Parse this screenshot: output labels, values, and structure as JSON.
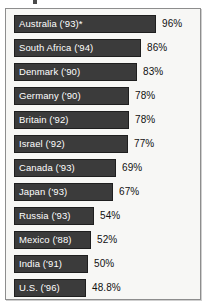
{
  "chart_data": {
    "type": "bar",
    "orientation": "horizontal",
    "title": "",
    "xlabel": "",
    "ylabel": "",
    "xlim": [
      0,
      100
    ],
    "grid": false,
    "legend": null,
    "value_suffix": "%",
    "categories": [
      "Australia ('93)*",
      "South Africa ('94)",
      "Denmark ('90)",
      "Germany ('90)",
      "Britain ('92)",
      "Israel ('92)",
      "Canada ('93)",
      "Japan ('93)",
      "Russia ('93)",
      "Mexico ('88)",
      "India ('91)",
      "U.S. ('96)"
    ],
    "values": [
      96,
      86,
      83,
      78,
      78,
      77,
      69,
      67,
      54,
      52,
      50,
      48.8
    ],
    "value_labels": [
      "96%",
      "86%",
      "83%",
      "78%",
      "78%",
      "77%",
      "69%",
      "67%",
      "54%",
      "52%",
      "50%",
      "48.8%"
    ],
    "rows": [
      {
        "label": "Australia ('93)*",
        "value": 96,
        "value_label": "96%"
      },
      {
        "label": "South Africa ('94)",
        "value": 86,
        "value_label": "86%"
      },
      {
        "label": "Denmark ('90)",
        "value": 83,
        "value_label": "83%"
      },
      {
        "label": "Germany ('90)",
        "value": 78,
        "value_label": "78%"
      },
      {
        "label": "Britain ('92)",
        "value": 78,
        "value_label": "78%"
      },
      {
        "label": "Israel ('92)",
        "value": 77,
        "value_label": "77%"
      },
      {
        "label": "Canada ('93)",
        "value": 69,
        "value_label": "69%"
      },
      {
        "label": "Japan ('93)",
        "value": 67,
        "value_label": "67%"
      },
      {
        "label": "Russia ('93)",
        "value": 54,
        "value_label": "54%"
      },
      {
        "label": "Mexico ('88)",
        "value": 52,
        "value_label": "52%"
      },
      {
        "label": "India ('91)",
        "value": 50,
        "value_label": "50%"
      },
      {
        "label": "U.S. ('96)",
        "value": 48.8,
        "value_label": "48.8%"
      }
    ]
  },
  "style": {
    "bar_color": "#3b3b3b",
    "bar_border_color": "#1f1f1f",
    "bar_label_color": "#ffffff",
    "value_color": "#111111",
    "panel_background": "#f7f7f5",
    "panel_border_color": "#8d8d8d",
    "page_background": "#ffffff"
  }
}
